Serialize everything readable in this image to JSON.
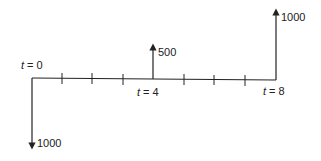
{
  "diagram": {
    "type": "cash-flow-diagram",
    "colors": {
      "line": "#222222",
      "text": "#222222",
      "background": "#ffffff"
    },
    "timeline": {
      "periods": 8,
      "start": 0,
      "end": 8
    },
    "time_labels": [
      {
        "var": "t",
        "eq": " = 0",
        "period": 0
      },
      {
        "var": "t",
        "eq": " = 4",
        "period": 4
      },
      {
        "var": "t",
        "eq": " = 8",
        "period": 8
      }
    ],
    "cash_flows": [
      {
        "period": 0,
        "direction": "down",
        "amount": "1000"
      },
      {
        "period": 4,
        "direction": "up",
        "amount": "500"
      },
      {
        "period": 8,
        "direction": "up",
        "amount": "1000"
      }
    ]
  }
}
